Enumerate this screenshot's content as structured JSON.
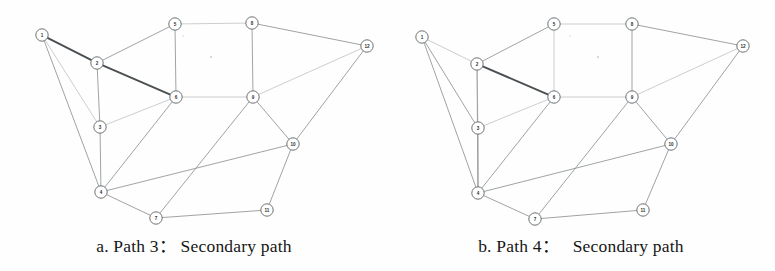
{
  "figure": {
    "background_color": "#fefefe",
    "edge_color": "#8e9295",
    "edge_faint_color": "#b9bdbf",
    "edge_bold_color": "#4a4f52",
    "node_fill": "#ffffff",
    "node_stroke": "#6d7275"
  },
  "panels": [
    {
      "id": "a",
      "caption": "a. Path 3： Secondary path",
      "caption_prefix": "a.",
      "caption_path_label": "Path 3",
      "caption_kind": "Secondary path",
      "nodes": [
        {
          "id": "1",
          "label": "1",
          "x": 42,
          "y": 35
        },
        {
          "id": "2",
          "label": "2",
          "x": 97,
          "y": 63
        },
        {
          "id": "3",
          "label": "3",
          "x": 100,
          "y": 127
        },
        {
          "id": "4",
          "label": "4",
          "x": 101,
          "y": 192
        },
        {
          "id": "5",
          "label": "5",
          "x": 175,
          "y": 24
        },
        {
          "id": "6",
          "label": "6",
          "x": 176,
          "y": 97
        },
        {
          "id": "7",
          "label": "7",
          "x": 156,
          "y": 218
        },
        {
          "id": "8",
          "label": "8",
          "x": 252,
          "y": 23
        },
        {
          "id": "9",
          "label": "9",
          "x": 253,
          "y": 97
        },
        {
          "id": "10",
          "label": "10",
          "x": 293,
          "y": 144
        },
        {
          "id": "11",
          "label": "11",
          "x": 267,
          "y": 210
        },
        {
          "id": "12",
          "label": "12",
          "x": 367,
          "y": 46
        }
      ],
      "edges": [
        {
          "from": "1",
          "to": "2",
          "style": "bold"
        },
        {
          "from": "1",
          "to": "3",
          "style": "faint"
        },
        {
          "from": "1",
          "to": "4",
          "style": "normal"
        },
        {
          "from": "2",
          "to": "3",
          "style": "normal"
        },
        {
          "from": "2",
          "to": "5",
          "style": "normal"
        },
        {
          "from": "2",
          "to": "6",
          "style": "bold"
        },
        {
          "from": "3",
          "to": "4",
          "style": "normal"
        },
        {
          "from": "3",
          "to": "6",
          "style": "faint"
        },
        {
          "from": "4",
          "to": "6",
          "style": "normal"
        },
        {
          "from": "4",
          "to": "7",
          "style": "normal"
        },
        {
          "from": "4",
          "to": "10",
          "style": "normal"
        },
        {
          "from": "5",
          "to": "6",
          "style": "normal"
        },
        {
          "from": "5",
          "to": "8",
          "style": "faint"
        },
        {
          "from": "6",
          "to": "9",
          "style": "faint"
        },
        {
          "from": "7",
          "to": "9",
          "style": "normal"
        },
        {
          "from": "7",
          "to": "11",
          "style": "normal"
        },
        {
          "from": "8",
          "to": "9",
          "style": "normal"
        },
        {
          "from": "8",
          "to": "12",
          "style": "normal"
        },
        {
          "from": "9",
          "to": "10",
          "style": "normal"
        },
        {
          "from": "9",
          "to": "12",
          "style": "faint"
        },
        {
          "from": "10",
          "to": "11",
          "style": "normal"
        },
        {
          "from": "10",
          "to": "12",
          "style": "normal"
        }
      ],
      "highlighted_path": [
        "1",
        "2",
        "6"
      ]
    },
    {
      "id": "b",
      "caption": "b. Path 4：   Secondary path",
      "caption_prefix": "b.",
      "caption_path_label": "Path 4",
      "caption_kind": "Secondary path",
      "nodes": [
        {
          "id": "1",
          "label": "1",
          "x": 35,
          "y": 37
        },
        {
          "id": "2",
          "label": "2",
          "x": 90,
          "y": 64
        },
        {
          "id": "3",
          "label": "3",
          "x": 91,
          "y": 128
        },
        {
          "id": "4",
          "label": "4",
          "x": 91,
          "y": 193
        },
        {
          "id": "5",
          "label": "5",
          "x": 167,
          "y": 24
        },
        {
          "id": "6",
          "label": "6",
          "x": 167,
          "y": 97
        },
        {
          "id": "7",
          "label": "7",
          "x": 148,
          "y": 219
        },
        {
          "id": "8",
          "label": "8",
          "x": 245,
          "y": 24
        },
        {
          "id": "9",
          "label": "9",
          "x": 245,
          "y": 97
        },
        {
          "id": "10",
          "label": "10",
          "x": 284,
          "y": 144
        },
        {
          "id": "11",
          "label": "11",
          "x": 256,
          "y": 210
        },
        {
          "id": "12",
          "label": "12",
          "x": 356,
          "y": 46
        }
      ],
      "edges": [
        {
          "from": "1",
          "to": "2",
          "style": "faint"
        },
        {
          "from": "1",
          "to": "3",
          "style": "normal"
        },
        {
          "from": "1",
          "to": "4",
          "style": "normal"
        },
        {
          "from": "2",
          "to": "3",
          "style": "faint"
        },
        {
          "from": "2",
          "to": "4",
          "style": "normal"
        },
        {
          "from": "2",
          "to": "5",
          "style": "normal"
        },
        {
          "from": "2",
          "to": "6",
          "style": "bold"
        },
        {
          "from": "3",
          "to": "4",
          "style": "normal"
        },
        {
          "from": "3",
          "to": "6",
          "style": "faint"
        },
        {
          "from": "4",
          "to": "6",
          "style": "normal"
        },
        {
          "from": "4",
          "to": "7",
          "style": "normal"
        },
        {
          "from": "4",
          "to": "10",
          "style": "normal"
        },
        {
          "from": "5",
          "to": "6",
          "style": "faint"
        },
        {
          "from": "5",
          "to": "8",
          "style": "faint"
        },
        {
          "from": "6",
          "to": "9",
          "style": "faint"
        },
        {
          "from": "7",
          "to": "9",
          "style": "normal"
        },
        {
          "from": "7",
          "to": "11",
          "style": "normal"
        },
        {
          "from": "8",
          "to": "9",
          "style": "normal"
        },
        {
          "from": "8",
          "to": "12",
          "style": "normal"
        },
        {
          "from": "9",
          "to": "10",
          "style": "normal"
        },
        {
          "from": "9",
          "to": "12",
          "style": "faint"
        },
        {
          "from": "10",
          "to": "11",
          "style": "normal"
        },
        {
          "from": "10",
          "to": "12",
          "style": "normal"
        }
      ],
      "highlighted_path": [
        "2",
        "6"
      ]
    }
  ]
}
